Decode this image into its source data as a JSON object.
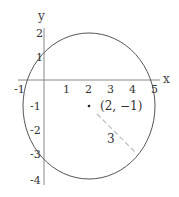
{
  "diagram": {
    "type": "circle-on-coordinate-plane",
    "axes": {
      "x_label": "x",
      "y_label": "y",
      "x_ticks": [
        "-1",
        "1",
        "2",
        "3",
        "4",
        "5"
      ],
      "y_ticks": [
        "2",
        "1",
        "-1",
        "-2",
        "-3",
        "-4"
      ]
    },
    "circle": {
      "center_label": "(2, −1)",
      "center": [
        2,
        -1
      ],
      "radius": 3,
      "radius_label": "3"
    },
    "colors": {
      "axis": "#888888",
      "circle": "#555555",
      "radius_line": "#bbbbbb",
      "text": "#333333"
    }
  }
}
